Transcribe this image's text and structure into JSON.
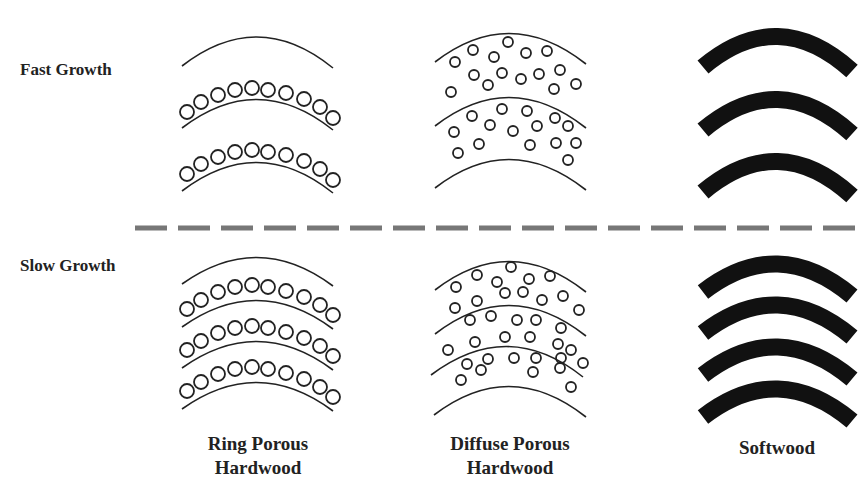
{
  "diagram": {
    "title": "",
    "row_labels": {
      "fast": "Fast Growth",
      "slow": "Slow Growth"
    },
    "column_labels": {
      "ring_porous": {
        "line1": "Ring Porous",
        "line2": "Hardwood"
      },
      "diffuse_porous": {
        "line1": "Diffuse Porous",
        "line2": "Hardwood"
      },
      "softwood": {
        "line1": "Softwood"
      }
    },
    "divider": {
      "style": "dashed",
      "color": "#777777"
    },
    "colors": {
      "line": "#222222",
      "softwood_band": "#111111",
      "background": "#ffffff"
    },
    "panels": [
      {
        "row": "fast",
        "type": "ring_porous",
        "pore_rows": 2,
        "ring_lines": 3
      },
      {
        "row": "fast",
        "type": "diffuse_porous",
        "ring_lines": 3
      },
      {
        "row": "fast",
        "type": "softwood",
        "bands": 3
      },
      {
        "row": "slow",
        "type": "ring_porous",
        "pore_rows": 3,
        "ring_lines": 4
      },
      {
        "row": "slow",
        "type": "diffuse_porous",
        "ring_lines": 4
      },
      {
        "row": "slow",
        "type": "softwood",
        "bands": 4
      }
    ]
  }
}
